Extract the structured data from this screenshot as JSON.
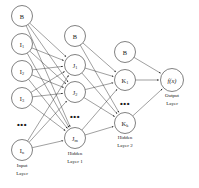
{
  "diagram": {
    "background_color": "#ffffff",
    "node_stroke_color": "#4a4a4a",
    "edge_color": "#2b2b2b",
    "text_color": "#1a1a1a",
    "ellipsis_glyph": "•••"
  },
  "layers": [
    {
      "id": "input",
      "caption_line1": "Input",
      "caption_line2": "Layer",
      "caption_x": 22,
      "caption_y1": 167,
      "caption_y2": 175,
      "x": 22,
      "radius": 10.5,
      "nodes": [
        {
          "id": "in-bias",
          "main": "B",
          "sub": "",
          "y": 16,
          "type": "bias"
        },
        {
          "id": "in-1",
          "main": "I",
          "sub": "1",
          "y": 44,
          "type": "unit"
        },
        {
          "id": "in-2",
          "main": "I",
          "sub": "2",
          "y": 71,
          "type": "unit"
        },
        {
          "id": "in-3",
          "main": "I",
          "sub": "3",
          "y": 98,
          "type": "unit"
        },
        {
          "id": "in-dots",
          "main": "",
          "sub": "",
          "y": 124,
          "type": "ellipsis"
        },
        {
          "id": "in-n",
          "main": "I",
          "sub": "n",
          "y": 150,
          "type": "unit"
        }
      ]
    },
    {
      "id": "hidden1",
      "caption_line1": "Hidden",
      "caption_line2": "Layer 1",
      "caption_x": 75,
      "caption_y1": 155,
      "caption_y2": 163,
      "x": 75,
      "radius": 10.5,
      "nodes": [
        {
          "id": "h1-bias",
          "main": "B",
          "sub": "",
          "y": 36,
          "type": "bias"
        },
        {
          "id": "h1-1",
          "main": "J",
          "sub": "1",
          "y": 65,
          "type": "unit"
        },
        {
          "id": "h1-2",
          "main": "J",
          "sub": "2",
          "y": 92,
          "type": "unit"
        },
        {
          "id": "h1-dots",
          "main": "",
          "sub": "",
          "y": 116,
          "type": "ellipsis"
        },
        {
          "id": "h1-m",
          "main": "J",
          "sub": "m",
          "y": 138,
          "type": "unit"
        }
      ]
    },
    {
      "id": "hidden2",
      "caption_line1": "Hidden",
      "caption_line2": "Layer 2",
      "caption_x": 125,
      "caption_y1": 139,
      "caption_y2": 147,
      "x": 125,
      "radius": 10.5,
      "nodes": [
        {
          "id": "h2-bias",
          "main": "B",
          "sub": "",
          "y": 52,
          "type": "bias"
        },
        {
          "id": "h2-1",
          "main": "K",
          "sub": "1",
          "y": 80,
          "type": "unit"
        },
        {
          "id": "h2-dots",
          "main": "",
          "sub": "",
          "y": 103,
          "type": "ellipsis"
        },
        {
          "id": "h2-k",
          "main": "K",
          "sub": "k",
          "y": 123,
          "type": "unit"
        }
      ]
    },
    {
      "id": "output",
      "caption_line1": "Output",
      "caption_line2": "Layer",
      "caption_x": 172,
      "caption_y1": 97,
      "caption_y2": 105,
      "x": 172,
      "radius": 11.5,
      "nodes": [
        {
          "id": "out-1",
          "main": "f(x)",
          "sub": "",
          "y": 80,
          "type": "output"
        }
      ]
    }
  ]
}
